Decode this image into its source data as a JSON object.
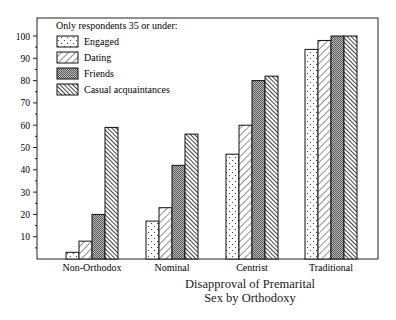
{
  "chart_data": {
    "type": "bar",
    "title_lines": [
      "Disapproval of Premarital",
      "Sex by Orthodoxy"
    ],
    "xlabel": "",
    "ylabel": "",
    "ylim": [
      0,
      100
    ],
    "yticks": [
      10,
      20,
      30,
      40,
      50,
      60,
      70,
      80,
      90,
      100
    ],
    "grid": false,
    "legend_title": "Only respondents 35 or under:",
    "legend_position": "upper left (inside plot)",
    "categories": [
      "Non-Orthodox",
      "Nominal",
      "Centrist",
      "Traditional"
    ],
    "series": [
      {
        "name": "Engaged",
        "pattern": "dots",
        "values": [
          3,
          17,
          47,
          94
        ]
      },
      {
        "name": "Dating",
        "pattern": "back-diagonal",
        "values": [
          8,
          23,
          60,
          98
        ]
      },
      {
        "name": "Friends",
        "pattern": "fine-crosshatch",
        "values": [
          20,
          42,
          80,
          100
        ]
      },
      {
        "name": "Casual acquaintances",
        "pattern": "forward-diagonal-dense",
        "values": [
          59,
          56,
          82,
          100
        ]
      }
    ]
  }
}
